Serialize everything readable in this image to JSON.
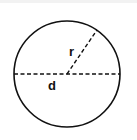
{
  "diagram": {
    "shape": "circle",
    "center": {
      "x": 67,
      "y": 74
    },
    "radius": 53,
    "stroke_color": "#111111",
    "labels": {
      "radius": "r",
      "diameter": "d"
    },
    "radius_line": {
      "x1": 67,
      "y1": 74,
      "x2": 97,
      "y2": 30,
      "style": "dashed"
    },
    "diameter_line": {
      "x1": 14,
      "y1": 74,
      "x2": 120,
      "y2": 74,
      "style": "dashed"
    }
  }
}
